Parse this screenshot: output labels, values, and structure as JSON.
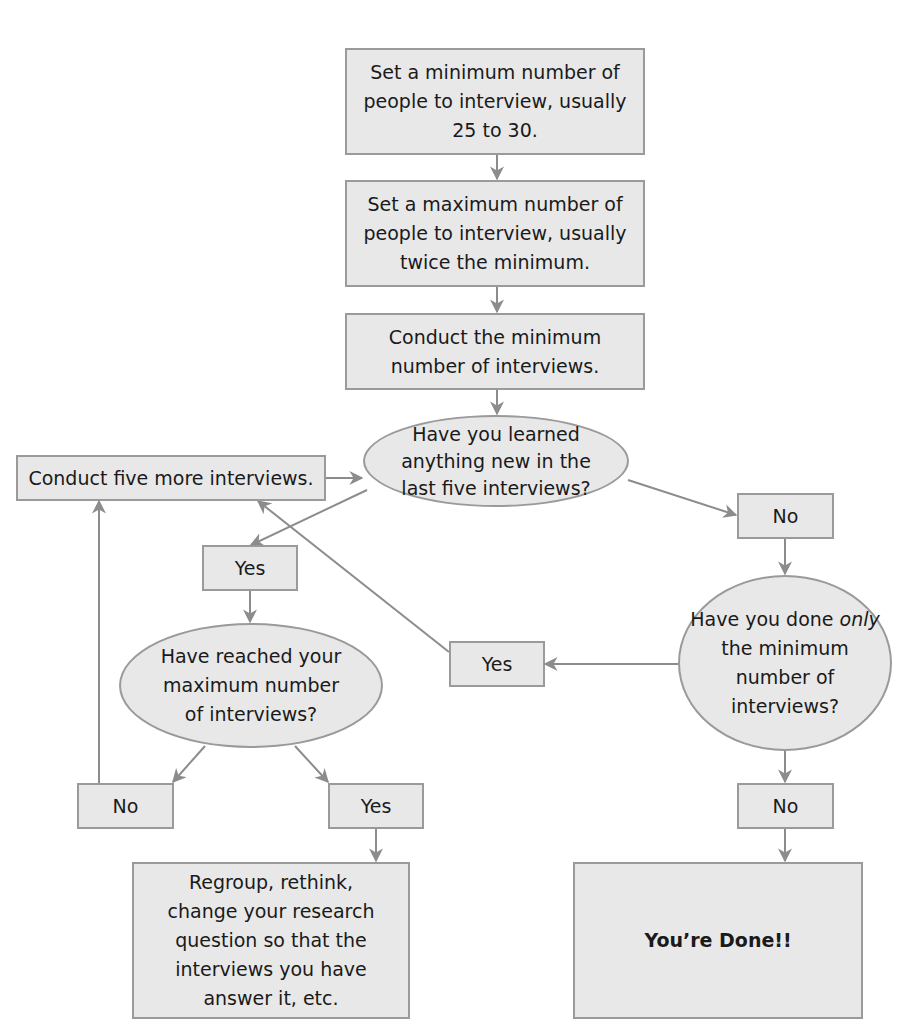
{
  "diagram": {
    "type": "flowchart",
    "colors": {
      "node_fill": "#e8e8e8",
      "node_border": "#9a9a9a",
      "edge": "#8c8c8c",
      "text": "#1a1a1a"
    },
    "nodes": {
      "set_min": {
        "shape": "rect",
        "text": "Set a minimum number of people to interview, usually 25 to 30."
      },
      "set_max": {
        "shape": "rect",
        "text": "Set a maximum number of people to interview, usually twice the minimum."
      },
      "conduct_min": {
        "shape": "rect",
        "text": "Conduct the minimum number of interviews."
      },
      "learned_new": {
        "shape": "ellipse",
        "text": "Have you learned anything new in the last five interviews?"
      },
      "conduct_five": {
        "shape": "rect",
        "text": "Conduct five more interviews."
      },
      "no_1": {
        "shape": "rect",
        "text": "No"
      },
      "yes_1": {
        "shape": "rect",
        "text": "Yes"
      },
      "reached_max": {
        "shape": "ellipse",
        "text": "Have reached your maximum number of interviews?"
      },
      "only_min": {
        "shape": "ellipse",
        "text_before": "Have you done ",
        "text_em": "only",
        "text_after": " the minimum number of interviews?"
      },
      "yes_2": {
        "shape": "rect",
        "text": "Yes"
      },
      "no_2": {
        "shape": "rect",
        "text": "No"
      },
      "yes_3": {
        "shape": "rect",
        "text": "Yes"
      },
      "no_3": {
        "shape": "rect",
        "text": "No"
      },
      "regroup": {
        "shape": "rect",
        "text": "Regroup, rethink, change your research question so that the interviews you have answer it, etc."
      },
      "done": {
        "shape": "rect",
        "text": "You’re Done!!"
      }
    },
    "edges": [
      {
        "from": "set_min",
        "to": "set_max"
      },
      {
        "from": "set_max",
        "to": "conduct_min"
      },
      {
        "from": "conduct_min",
        "to": "learned_new"
      },
      {
        "from": "conduct_five",
        "to": "learned_new"
      },
      {
        "from": "learned_new",
        "to": "no_1"
      },
      {
        "from": "learned_new",
        "to": "yes_1"
      },
      {
        "from": "no_1",
        "to": "only_min"
      },
      {
        "from": "yes_1",
        "to": "reached_max"
      },
      {
        "from": "only_min",
        "to": "yes_2"
      },
      {
        "from": "yes_2",
        "to": "conduct_five"
      },
      {
        "from": "reached_max",
        "to": "no_2"
      },
      {
        "from": "reached_max",
        "to": "yes_3"
      },
      {
        "from": "no_2",
        "to": "conduct_five"
      },
      {
        "from": "yes_3",
        "to": "regroup"
      },
      {
        "from": "only_min",
        "to": "no_3"
      },
      {
        "from": "no_3",
        "to": "done"
      }
    ]
  }
}
